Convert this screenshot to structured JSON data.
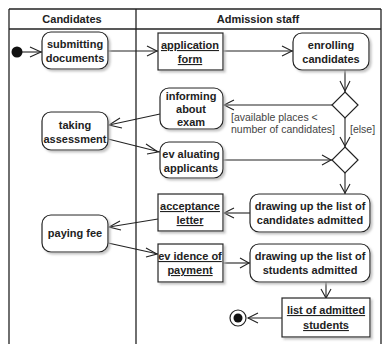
{
  "diagram": {
    "type": "UML activity diagram",
    "lanes": [
      {
        "id": "candidates",
        "label": "Candidates"
      },
      {
        "id": "staff",
        "label": "Admission staff"
      }
    ],
    "nodes": {
      "submitting": {
        "kind": "action",
        "lines": [
          "submitting",
          "documents"
        ]
      },
      "app_form": {
        "kind": "object",
        "lines": [
          "application",
          "form"
        ]
      },
      "enrolling": {
        "kind": "action",
        "lines": [
          "enrolling",
          "candidates"
        ]
      },
      "informing": {
        "kind": "action",
        "lines": [
          "informing",
          "about",
          "exam"
        ]
      },
      "taking": {
        "kind": "action",
        "lines": [
          "taking",
          "assessment"
        ]
      },
      "evaluating": {
        "kind": "action",
        "lines": [
          "ev aluating",
          "applicants"
        ]
      },
      "draw_cand": {
        "kind": "action",
        "lines": [
          "drawing up the list of",
          "candidates admitted"
        ]
      },
      "accept_letter": {
        "kind": "object",
        "lines": [
          "acceptance",
          "letter"
        ]
      },
      "paying": {
        "kind": "action",
        "lines": [
          "paying fee"
        ]
      },
      "evidence": {
        "kind": "object",
        "lines": [
          "ev idence of",
          "payment"
        ]
      },
      "draw_stud": {
        "kind": "action",
        "lines": [
          "drawing up the list of",
          "students admitted"
        ]
      },
      "list_students": {
        "kind": "object",
        "lines": [
          "list of admitted",
          "students"
        ]
      }
    },
    "guards": {
      "available": [
        "[available places <",
        "number of candidates]"
      ],
      "else": "[else]"
    },
    "colors": {
      "stroke": "#222222",
      "fill": "#ffffff",
      "shadow": "#c8c8c8",
      "guard_text": "#444444"
    }
  }
}
